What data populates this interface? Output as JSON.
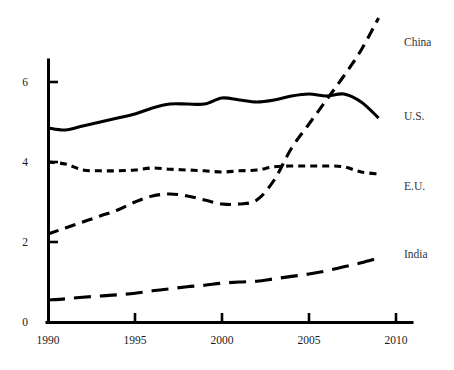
{
  "chart_data": {
    "type": "line",
    "title": "",
    "subtitle": "",
    "xlabel": "",
    "ylabel": "",
    "xlim": [
      1990,
      2010
    ],
    "ylim": [
      0,
      6.8
    ],
    "xticks": [
      1990,
      1995,
      2000,
      2005,
      2010
    ],
    "yticks": [
      0,
      2,
      4,
      6
    ],
    "grid": false,
    "legend_position": "right-inline-labels",
    "x": [
      1990,
      1991,
      1992,
      1993,
      1994,
      1995,
      1996,
      1997,
      1998,
      1999,
      2000,
      2001,
      2002,
      2003,
      2004,
      2005,
      2006,
      2007,
      2008,
      2009
    ],
    "series": [
      {
        "name": "China",
        "style": "short-dash",
        "values": [
          2.2,
          2.35,
          2.5,
          2.65,
          2.8,
          3.0,
          3.15,
          3.2,
          3.15,
          3.05,
          2.95,
          2.95,
          3.05,
          3.55,
          4.35,
          4.95,
          5.55,
          6.15,
          6.8,
          7.6
        ]
      },
      {
        "name": "U.S.",
        "style": "solid",
        "values": [
          4.85,
          4.8,
          4.9,
          5.0,
          5.1,
          5.2,
          5.35,
          5.45,
          5.45,
          5.45,
          5.6,
          5.55,
          5.5,
          5.55,
          5.65,
          5.7,
          5.65,
          5.7,
          5.5,
          5.1
        ]
      },
      {
        "name": "E.U.",
        "style": "medium-dash",
        "values": [
          4.0,
          3.95,
          3.8,
          3.78,
          3.78,
          3.8,
          3.85,
          3.82,
          3.8,
          3.78,
          3.75,
          3.78,
          3.8,
          3.88,
          3.9,
          3.9,
          3.9,
          3.88,
          3.75,
          3.7
        ]
      },
      {
        "name": "India",
        "style": "long-dash",
        "values": [
          0.55,
          0.58,
          0.62,
          0.65,
          0.68,
          0.72,
          0.78,
          0.83,
          0.88,
          0.92,
          0.97,
          1.0,
          1.02,
          1.08,
          1.14,
          1.2,
          1.28,
          1.38,
          1.48,
          1.6
        ]
      }
    ],
    "labels": {
      "china": "China",
      "us": "U.S.",
      "eu": "E.U.",
      "india": "India"
    },
    "xtick_labels": [
      "1990",
      "1995",
      "2000",
      "2005",
      "2010"
    ],
    "ytick_labels": [
      "0",
      "2",
      "4",
      "6"
    ],
    "colors": {
      "ink": "#000000",
      "text": "#333333",
      "background": "#ffffff"
    }
  }
}
